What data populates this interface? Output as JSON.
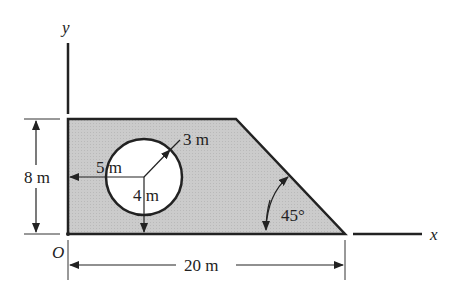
{
  "figure": {
    "axes": {
      "x_label": "x",
      "y_label": "y",
      "origin_label": "O"
    },
    "dimensions": {
      "height": "8 m",
      "width": "20 m",
      "hole_radius": "3 m",
      "hole_center_x": "5 m",
      "hole_center_y": "4 m",
      "angle": "45°"
    },
    "colors": {
      "fill": "#c8c8c8",
      "stroke": "#222222",
      "hole": "#ffffff"
    }
  }
}
